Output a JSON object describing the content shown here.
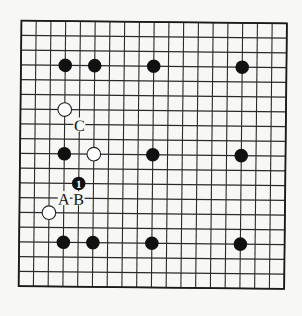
{
  "diagram": {
    "type": "go-board",
    "size": 19,
    "colors": {
      "background": "#f7f7f5",
      "line": "#2a2a2a",
      "black": "#111111",
      "white": "#ffffff"
    },
    "stones": [
      {
        "color": "black",
        "col": 3,
        "row": 3
      },
      {
        "color": "black",
        "col": 5,
        "row": 3
      },
      {
        "color": "black",
        "col": 9,
        "row": 3
      },
      {
        "color": "black",
        "col": 15,
        "row": 3
      },
      {
        "color": "white",
        "col": 3,
        "row": 6
      },
      {
        "color": "black",
        "col": 3,
        "row": 9
      },
      {
        "color": "white",
        "col": 5,
        "row": 9
      },
      {
        "color": "black",
        "col": 9,
        "row": 9
      },
      {
        "color": "black",
        "col": 15,
        "row": 9
      },
      {
        "color": "black",
        "col": 4,
        "row": 11,
        "move": "1"
      },
      {
        "color": "white",
        "col": 2,
        "row": 13
      },
      {
        "color": "black",
        "col": 3,
        "row": 15
      },
      {
        "color": "black",
        "col": 5,
        "row": 15
      },
      {
        "color": "black",
        "col": 9,
        "row": 15
      },
      {
        "color": "black",
        "col": 15,
        "row": 15
      }
    ],
    "labels": [
      {
        "text": "C",
        "col": 4,
        "row": 7
      },
      {
        "text": "A",
        "col": 3,
        "row": 12
      },
      {
        "text": "B",
        "col": 4,
        "row": 12
      }
    ]
  }
}
